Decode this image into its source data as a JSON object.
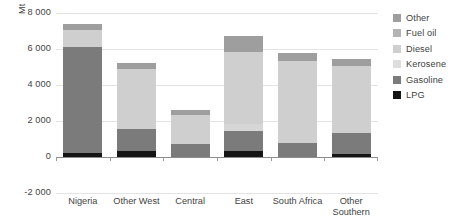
{
  "chart_data": {
    "type": "bar",
    "subtype": "stacked-column",
    "title": "",
    "xlabel": "",
    "ylabel": "Mt",
    "ylim": [
      -2000,
      8000
    ],
    "yticks": [
      8000,
      6000,
      4000,
      2000,
      0,
      -2000
    ],
    "ytick_labels": [
      "8 000",
      "6 000",
      "4 000",
      "2 000",
      "0",
      "-2 000"
    ],
    "grid": true,
    "legend_position": "right",
    "categories": [
      "Nigeria",
      "Other West",
      "Central",
      "East",
      "South Africa",
      "Other Southern"
    ],
    "series": [
      {
        "name": "LPG",
        "color": "#151515",
        "values": [
          200,
          320,
          0,
          330,
          0,
          170
        ]
      },
      {
        "name": "Gasoline",
        "color": "#7b7b7b",
        "values": [
          5900,
          1230,
          700,
          1130,
          800,
          1180
        ]
      },
      {
        "name": "Kerosene",
        "color": "#d6d6d6",
        "values": [
          0,
          0,
          0,
          360,
          0,
          0
        ]
      },
      {
        "name": "Diesel",
        "color": "#cfcfcf",
        "values": [
          950,
          3350,
          1640,
          4000,
          4560,
          3700
        ]
      },
      {
        "name": "Fuel oil",
        "color": "#c4c4c4",
        "values": [
          0,
          0,
          0,
          0,
          0,
          0
        ]
      },
      {
        "name": "Other",
        "color": "#9e9e9e",
        "values": [
          340,
          310,
          260,
          900,
          440,
          390
        ]
      }
    ],
    "totals": [
      7390,
      5210,
      2600,
      6720,
      5800,
      5440
    ],
    "stack_order_bottom_to_top": [
      "LPG",
      "Gasoline",
      "Kerosene",
      "Diesel",
      "Fuel oil",
      "Other"
    ]
  },
  "legend": {
    "items": [
      {
        "label": "Other",
        "color": "#9e9e9e"
      },
      {
        "label": "Fuel oil",
        "color": "#b4b4b4"
      },
      {
        "label": "Diesel",
        "color": "#cfcfcf"
      },
      {
        "label": "Kerosene",
        "color": "#dedede"
      },
      {
        "label": "Gasoline",
        "color": "#7b7b7b"
      },
      {
        "label": "LPG",
        "color": "#151515"
      }
    ]
  }
}
